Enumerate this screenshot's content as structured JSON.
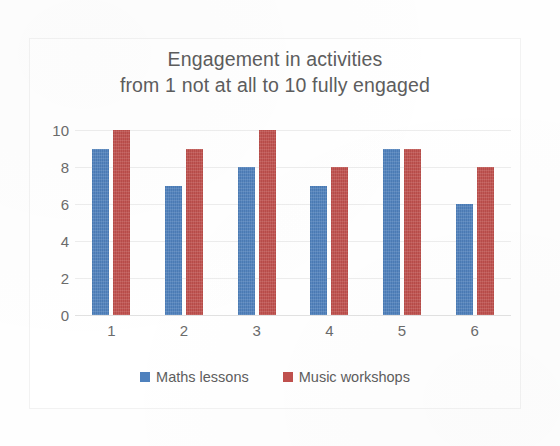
{
  "chart_data": {
    "type": "bar",
    "title": "Engagement in activities\nfrom 1 not at all to 10 fully engaged",
    "title_line1": "Engagement in activities",
    "title_line2": "from 1 not at all to 10 fully engaged",
    "categories": [
      "1",
      "2",
      "3",
      "4",
      "5",
      "6"
    ],
    "series": [
      {
        "name": "Maths lessons",
        "color": "#4F81BD",
        "values": [
          9,
          7,
          8,
          7,
          9,
          6
        ]
      },
      {
        "name": "Music workshops",
        "color": "#C0504D",
        "values": [
          10,
          9,
          10,
          8,
          9,
          8
        ]
      }
    ],
    "xlabel": "",
    "ylabel": "",
    "ylim": [
      0,
      10
    ],
    "yticks": [
      "0",
      "2",
      "4",
      "6",
      "8",
      "10"
    ],
    "ytick_values": [
      0,
      2,
      4,
      6,
      8,
      10
    ],
    "grid": true,
    "legend_position": "bottom"
  },
  "colors": {
    "series_maths": "#4F81BD",
    "series_music": "#C0504D",
    "text": "#5D5D5D",
    "tick_text": "#6B6B6B",
    "gridline": "#EDEDED",
    "background": "#FFFFFF"
  }
}
